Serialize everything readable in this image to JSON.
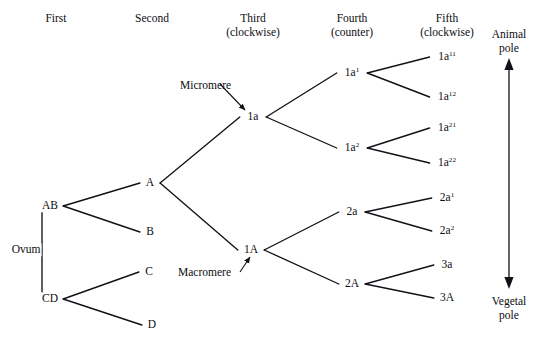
{
  "figure": {
    "background_color": "#ffffff",
    "line_color": "#111118"
  },
  "columns": [
    {
      "name": "First",
      "sub": "",
      "x": 56
    },
    {
      "name": "Second",
      "sub": "",
      "x": 152
    },
    {
      "name": "Third",
      "sub": "(clockwise)",
      "x": 253
    },
    {
      "name": "Fourth",
      "sub": "(counter)",
      "x": 352
    },
    {
      "name": "Fifth",
      "sub": "(clockwise)",
      "x": 447
    }
  ],
  "origin": {
    "label": "Ovum",
    "x": 26,
    "y": 250
  },
  "nodes": [
    {
      "id": "AB",
      "label": "AB",
      "base": "AB",
      "sup": "",
      "x": 50,
      "y": 206
    },
    {
      "id": "CD",
      "label": "CD",
      "base": "CD",
      "sup": "",
      "x": 50,
      "y": 299
    },
    {
      "id": "A",
      "label": "A",
      "base": "A",
      "sup": "",
      "x": 150,
      "y": 183
    },
    {
      "id": "B",
      "label": "B",
      "base": "B",
      "sup": "",
      "x": 150,
      "y": 232
    },
    {
      "id": "C",
      "label": "C",
      "base": "C",
      "sup": "",
      "x": 149,
      "y": 272
    },
    {
      "id": "D",
      "label": "D",
      "base": "D",
      "sup": "",
      "x": 152,
      "y": 325
    },
    {
      "id": "1a",
      "label": "1a",
      "base": "1a",
      "sup": "",
      "x": 253,
      "y": 117
    },
    {
      "id": "1A",
      "label": "1A",
      "base": "1A",
      "sup": "",
      "x": 251,
      "y": 250
    },
    {
      "id": "1a1",
      "label": "1a1",
      "base": "1a",
      "sup": "1",
      "x": 352,
      "y": 73
    },
    {
      "id": "1a2",
      "label": "1a2",
      "base": "1a",
      "sup": "2",
      "x": 352,
      "y": 148
    },
    {
      "id": "2a",
      "label": "2a",
      "base": "2a",
      "sup": "",
      "x": 352,
      "y": 212
    },
    {
      "id": "2A",
      "label": "2A",
      "base": "2A",
      "sup": "",
      "x": 352,
      "y": 284
    },
    {
      "id": "1a11",
      "label": "1a11",
      "base": "1a",
      "sup": "11",
      "x": 447,
      "y": 57
    },
    {
      "id": "1a12",
      "label": "1a12",
      "base": "1a",
      "sup": "12",
      "x": 447,
      "y": 97
    },
    {
      "id": "1a21",
      "label": "1a21",
      "base": "1a",
      "sup": "21",
      "x": 447,
      "y": 128
    },
    {
      "id": "1a22",
      "label": "1a22",
      "base": "1a",
      "sup": "22",
      "x": 447,
      "y": 163
    },
    {
      "id": "2a1",
      "label": "2a1",
      "base": "2a",
      "sup": "1",
      "x": 447,
      "y": 198
    },
    {
      "id": "2a2",
      "label": "2a2",
      "base": "2a",
      "sup": "2",
      "x": 447,
      "y": 231
    },
    {
      "id": "3a",
      "label": "3a",
      "base": "3a",
      "sup": "",
      "x": 447,
      "y": 265
    },
    {
      "id": "3A",
      "label": "3A",
      "base": "3A",
      "sup": "",
      "x": 447,
      "y": 298
    }
  ],
  "edges": [
    {
      "from": "AB",
      "to": "A"
    },
    {
      "from": "AB",
      "to": "B"
    },
    {
      "from": "CD",
      "to": "C"
    },
    {
      "from": "CD",
      "to": "D"
    },
    {
      "from": "A",
      "to": "1a"
    },
    {
      "from": "A",
      "to": "1A"
    },
    {
      "from": "1a",
      "to": "1a1"
    },
    {
      "from": "1a",
      "to": "1a2"
    },
    {
      "from": "1A",
      "to": "2a"
    },
    {
      "from": "1A",
      "to": "2A"
    },
    {
      "from": "1a1",
      "to": "1a11"
    },
    {
      "from": "1a1",
      "to": "1a12"
    },
    {
      "from": "1a2",
      "to": "1a21"
    },
    {
      "from": "1a2",
      "to": "1a22"
    },
    {
      "from": "2a",
      "to": "2a1"
    },
    {
      "from": "2a",
      "to": "2a2"
    },
    {
      "from": "2A",
      "to": "3a"
    },
    {
      "from": "2A",
      "to": "3A"
    }
  ],
  "annotations": [
    {
      "id": "micromere",
      "text": "Micromere",
      "x": 180,
      "y": 79,
      "target": "1a"
    },
    {
      "id": "macromere",
      "text": "Macromere",
      "x": 178,
      "y": 266,
      "target": "1A"
    }
  ],
  "axis": {
    "animal_pole": {
      "line1": "Animal",
      "line2": "pole"
    },
    "vegetal_pole": {
      "line1": "Vegetal",
      "line2": "pole"
    },
    "x": 509,
    "top_y": 60,
    "bottom_y": 287
  }
}
